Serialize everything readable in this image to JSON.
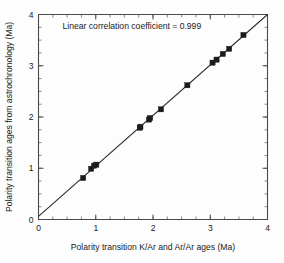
{
  "chart_data": {
    "type": "scatter",
    "title": "",
    "xlabel": "Polarity transition K/Ar and Ar/Ar ages (Ma)",
    "ylabel": "Polarity transition ages from astrochronology (Ma)",
    "xlim": [
      0,
      4
    ],
    "ylim": [
      0,
      4
    ],
    "xticks": [
      0,
      1,
      2,
      3,
      4
    ],
    "yticks": [
      0,
      1,
      2,
      3,
      4
    ],
    "xticklabels": [
      "0",
      "1",
      "2",
      "3",
      "4"
    ],
    "yticklabels": [
      "0",
      "1",
      "2",
      "3",
      "4"
    ],
    "xminor_step": 0.25,
    "yminor_step": 0.25,
    "grid": false,
    "legend": null,
    "annotations": [
      {
        "text": "Linear correlation coefficient = 0.999",
        "x": 0.42,
        "y": 3.72
      }
    ],
    "series": [
      {
        "name": "Polarity transitions",
        "marker": "square",
        "color": "#1b1b1b",
        "x": [
          0.78,
          0.92,
          0.97,
          1.01,
          1.77,
          1.78,
          1.93,
          1.95,
          2.14,
          2.6,
          3.04,
          3.11,
          3.22,
          3.33,
          3.58
        ],
        "y": [
          0.81,
          0.99,
          1.05,
          1.07,
          1.79,
          1.81,
          1.95,
          1.98,
          2.15,
          2.62,
          3.06,
          3.12,
          3.23,
          3.33,
          3.6
        ]
      }
    ],
    "fit_line": {
      "name": "1:1 correlation line",
      "x0": 0.0,
      "y0": 0.06,
      "x1": 4.0,
      "y1": 4.0,
      "color": "#2b2b2b"
    }
  }
}
